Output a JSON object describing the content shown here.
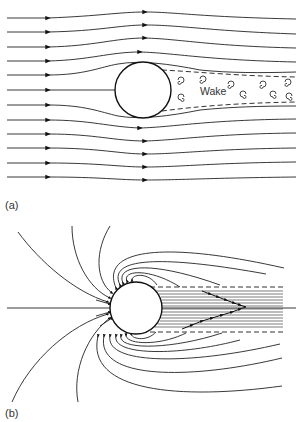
{
  "figure": {
    "panel_a": {
      "label": "(a)",
      "wake_label": "Wake",
      "description": "Uniform flow streamlines around a sphere with turbulent wake downstream"
    },
    "panel_b": {
      "label": "(b)",
      "description": "Field lines converging on a sphere with a confined shadow region downstream"
    },
    "colors": {
      "line": "#222222",
      "background": "#ffffff"
    }
  }
}
